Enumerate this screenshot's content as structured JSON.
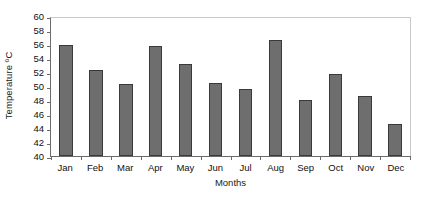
{
  "chart_data": {
    "type": "bar",
    "title": "",
    "xlabel": "Months",
    "ylabel": "Temperature ºC",
    "categories": [
      "Jan",
      "Feb",
      "Mar",
      "Apr",
      "May",
      "Jun",
      "Jul",
      "Aug",
      "Sep",
      "Oct",
      "Nov",
      "Dec"
    ],
    "values": [
      55.9,
      52.3,
      50.3,
      55.7,
      53.1,
      50.4,
      49.6,
      56.6,
      48.0,
      51.7,
      48.6,
      44.6
    ],
    "ylim": [
      40,
      60
    ],
    "ytick_step": 2,
    "yticks": [
      40,
      42,
      44,
      46,
      48,
      50,
      52,
      54,
      56,
      58,
      60
    ],
    "ytick_labels": [
      "40",
      "42",
      "44",
      "46",
      "48",
      "50",
      "52",
      "54",
      "56",
      "58",
      "60"
    ],
    "grid": false,
    "legend": false,
    "legend_position": "none",
    "bar_color": "#6e6e6e",
    "bar_border_color": "#3a3a3a",
    "axis_color": "#6b6b6b",
    "frame_color": "#c9c9c9",
    "background": "#ffffff"
  }
}
